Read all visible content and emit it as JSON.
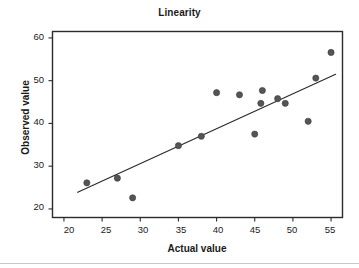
{
  "chart_data": {
    "type": "scatter",
    "title": "Linearity",
    "xlabel": "Actual value",
    "ylabel": "Observed value",
    "xlim": [
      18.5,
      56.5
    ],
    "ylim": [
      18.0,
      61.5
    ],
    "xticks": [
      20,
      25,
      30,
      35,
      40,
      45,
      50,
      55
    ],
    "yticks": [
      20,
      30,
      40,
      50,
      60
    ],
    "grid": false,
    "legend": null,
    "marker_color": "#555555",
    "line_color": "#2b2b2b",
    "frame_color": "#2b2b2b",
    "background": "#ffffff",
    "series": [
      {
        "name": "Observed vs Actual",
        "x": [
          23,
          27,
          29,
          35,
          38,
          40,
          43,
          45,
          45.8,
          46,
          48,
          49,
          52,
          53,
          55
        ],
        "y": [
          26.1,
          27.2,
          22.6,
          34.8,
          37.0,
          47.2,
          46.7,
          37.5,
          44.7,
          47.7,
          45.8,
          44.7,
          40.5,
          50.6,
          56.6
        ]
      }
    ],
    "fit_line": {
      "name": "regression line",
      "x_start": 21.8,
      "y_start": 23.9,
      "x_end": 55.6,
      "y_end": 51.5
    }
  },
  "axes": {
    "y_tick_labels": [
      "60",
      "50",
      "40",
      "30",
      "20"
    ],
    "x_tick_labels": [
      "20",
      "25",
      "30",
      "35",
      "40",
      "45",
      "50",
      "55"
    ]
  }
}
